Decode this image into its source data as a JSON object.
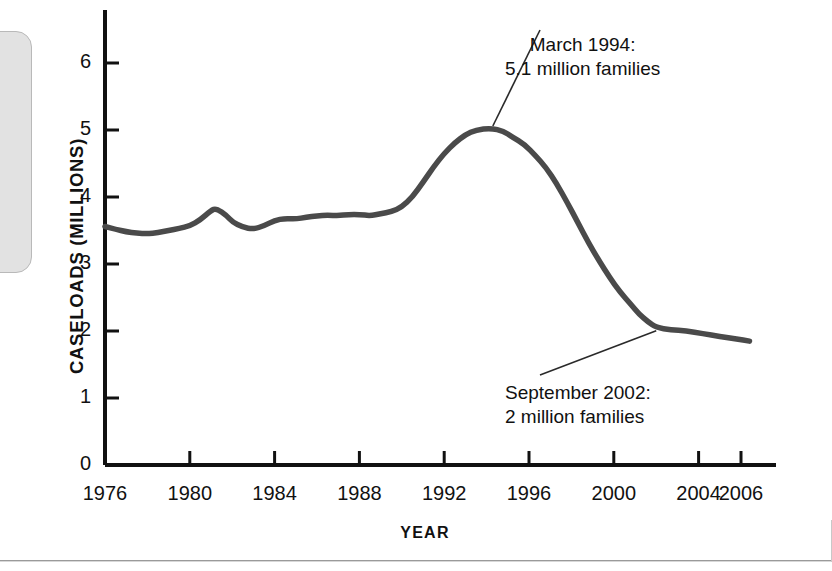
{
  "chart_data": {
    "type": "line",
    "title": "",
    "xlabel": "YEAR",
    "ylabel": "CASELOADS (MILLIONS)",
    "xlim": [
      1976,
      2006.6
    ],
    "ylim": [
      0,
      6.6
    ],
    "grid": false,
    "legend": "none",
    "x_ticks": [
      1976,
      1980,
      1984,
      1988,
      1992,
      1996,
      2000,
      2004,
      2006
    ],
    "x_tick_labels": [
      "1976",
      "1980",
      "1984",
      "1988",
      "1992",
      "1996",
      "2000",
      "2004",
      "2006"
    ],
    "y_ticks": [
      0,
      1,
      2,
      3,
      4,
      5,
      6
    ],
    "y_tick_labels": [
      "0",
      "1",
      "2",
      "3",
      "4",
      "5",
      "6"
    ],
    "line_color": "#4a4a4a",
    "series": [
      {
        "name": "Welfare caseloads",
        "x": [
          1976.0,
          1976.5,
          1977.0,
          1977.5,
          1978.0,
          1978.5,
          1979.0,
          1979.5,
          1980.0,
          1980.5,
          1981.0,
          1981.25,
          1981.75,
          1982.0,
          1982.5,
          1983.0,
          1983.5,
          1984.0,
          1984.5,
          1985.0,
          1985.5,
          1986.0,
          1986.5,
          1987.0,
          1987.5,
          1988.0,
          1988.5,
          1989.0,
          1989.5,
          1990.0,
          1990.5,
          1991.0,
          1991.5,
          1992.0,
          1992.5,
          1993.0,
          1993.5,
          1994.2,
          1994.8,
          1995.2,
          1995.8,
          1996.3,
          1996.8,
          1997.3,
          1997.8,
          1998.3,
          1998.8,
          1999.3,
          1999.8,
          2000.3,
          2000.8,
          2001.2,
          2001.6,
          2002.0,
          2002.7,
          2003.4,
          2004.2,
          2005.0,
          2005.8,
          2006.4
        ],
        "y": [
          3.56,
          3.52,
          3.48,
          3.46,
          3.45,
          3.47,
          3.5,
          3.53,
          3.57,
          3.66,
          3.8,
          3.83,
          3.72,
          3.63,
          3.55,
          3.52,
          3.57,
          3.65,
          3.68,
          3.67,
          3.7,
          3.72,
          3.73,
          3.72,
          3.74,
          3.74,
          3.72,
          3.75,
          3.78,
          3.85,
          4.0,
          4.22,
          4.45,
          4.65,
          4.81,
          4.93,
          5.0,
          5.03,
          4.98,
          4.9,
          4.78,
          4.62,
          4.44,
          4.2,
          3.92,
          3.62,
          3.32,
          3.05,
          2.8,
          2.58,
          2.4,
          2.25,
          2.14,
          2.05,
          2.02,
          2.0,
          1.96,
          1.92,
          1.88,
          1.85
        ]
      }
    ],
    "annotations": [
      {
        "id": "peak",
        "line1": "March 1994:",
        "line2": "5.1 million families",
        "point_x": 1994.2,
        "point_y": 5.03
      },
      {
        "id": "low",
        "line1": "September 2002:",
        "line2": "2 million families",
        "point_x": 2002.0,
        "point_y": 2.05
      }
    ]
  }
}
